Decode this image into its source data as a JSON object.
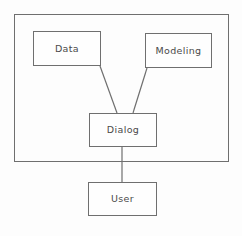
{
  "diagram": {
    "type": "block-diagram",
    "title": "",
    "background_color": "#fdfdfd",
    "line_color": "#6f6f6f",
    "text_color": "#4a4a4a",
    "boundary": {
      "name": "system-boundary",
      "label": "",
      "x": 14,
      "y": 14,
      "width": 215,
      "height": 148
    },
    "nodes": [
      {
        "id": "data",
        "label": "Data",
        "x": 33,
        "y": 31,
        "width": 68,
        "height": 35
      },
      {
        "id": "modeling",
        "label": "Modeling",
        "x": 145,
        "y": 33,
        "width": 67,
        "height": 35
      },
      {
        "id": "dialog",
        "label": "Dialog",
        "x": 89,
        "y": 113,
        "width": 68,
        "height": 34
      },
      {
        "id": "user",
        "label": "User",
        "x": 88,
        "y": 182,
        "width": 69,
        "height": 34
      }
    ],
    "edges": [
      {
        "id": "data-dialog",
        "from": "data",
        "to": "dialog",
        "x1": 100,
        "y1": 66,
        "x2": 117,
        "y2": 113
      },
      {
        "id": "modeling-dialog",
        "from": "modeling",
        "to": "dialog",
        "x1": 147,
        "y1": 68,
        "x2": 133,
        "y2": 113
      },
      {
        "id": "dialog-user",
        "from": "dialog",
        "to": "user",
        "x1": 122,
        "y1": 147,
        "x2": 122,
        "y2": 182
      }
    ]
  }
}
